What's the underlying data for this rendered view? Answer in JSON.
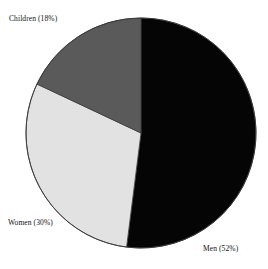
{
  "chart_data": {
    "type": "pie",
    "title": "",
    "categories": [
      "Men",
      "Women",
      "Children"
    ],
    "values": [
      52,
      30,
      18
    ],
    "unit": "%",
    "start_angle_deg": 0,
    "direction": "clockwise",
    "legend": "none",
    "labels_position": "outside",
    "slices": [
      {
        "name": "Men",
        "label": "Men (52%)",
        "value": 52,
        "color": "#050505",
        "start_deg": 0,
        "end_deg": 187.2
      },
      {
        "name": "Women",
        "label": "Women (30%)",
        "value": 30,
        "color": "#e2e2e2",
        "start_deg": 187.2,
        "end_deg": 295.2
      },
      {
        "name": "Children",
        "label": "Children (18%)",
        "value": 18,
        "color": "#5a5a5a",
        "start_deg": 295.2,
        "end_deg": 360
      }
    ],
    "geometry": {
      "center_x": 141,
      "center_y": 133,
      "radius": 115
    },
    "outline_color": "#3a3a3a"
  }
}
